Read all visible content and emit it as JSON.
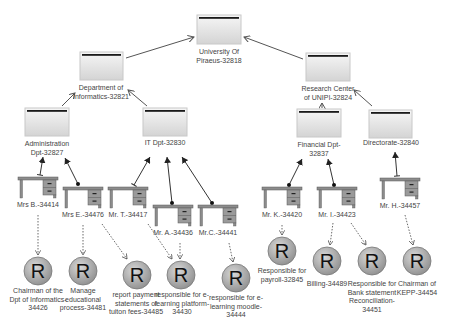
{
  "diagram": {
    "type": "organizational hierarchy",
    "units": [
      {
        "id": "u0",
        "label": "University Of\nPiraeus-32818",
        "x": 197,
        "y": 15,
        "lx": 219,
        "ly": 48
      },
      {
        "id": "u1",
        "label": "Department of\nInformatics-32821",
        "x": 80,
        "y": 52,
        "lx": 101,
        "ly": 84
      },
      {
        "id": "u2",
        "label": "Research Center\nof UNIPI-32824",
        "x": 306,
        "y": 53,
        "lx": 328,
        "ly": 85
      },
      {
        "id": "u3",
        "label": "Administration\nDpt-32827",
        "x": 25,
        "y": 108,
        "lx": 47,
        "ly": 140
      },
      {
        "id": "u4",
        "label": "IT Dpt-32830",
        "x": 143,
        "y": 108,
        "lx": 165,
        "ly": 140
      },
      {
        "id": "u5",
        "label": "Financial Dpt-\n32837",
        "x": 297,
        "y": 109,
        "lx": 319,
        "ly": 141
      },
      {
        "id": "u6",
        "label": "Directorate-32840",
        "x": 369,
        "y": 110,
        "lx": 391,
        "ly": 141
      }
    ],
    "persons": [
      {
        "id": "p0",
        "label": "Mrs B.-34414",
        "x": 18,
        "y": 177
      },
      {
        "id": "p1",
        "label": "Mrs E.-34476",
        "x": 63,
        "y": 187
      },
      {
        "id": "p2",
        "label": "Mr. T.-34417",
        "x": 108,
        "y": 187
      },
      {
        "id": "p3",
        "label": "Mr. A.-34436",
        "x": 153,
        "y": 205
      },
      {
        "id": "p4",
        "label": "Mr.C.-34441",
        "x": 198,
        "y": 205
      },
      {
        "id": "p5",
        "label": "Mr. K.-34420",
        "x": 262,
        "y": 187
      },
      {
        "id": "p6",
        "label": "Mr. I.-34423",
        "x": 317,
        "y": 187
      },
      {
        "id": "p7",
        "label": "Mr. H.-34457",
        "x": 380,
        "y": 178
      }
    ],
    "roles": [
      {
        "id": "r0",
        "label": "Chairman of the\nDpt of Informatics-\n34426",
        "cx": 38,
        "cy": 271
      },
      {
        "id": "r1",
        "label": "Manage\neducational\nprocess-34481",
        "cx": 83,
        "cy": 271
      },
      {
        "id": "r2",
        "label": "report payment\nstatements of\ntuiton fees-34485",
        "cx": 137,
        "cy": 275
      },
      {
        "id": "r3",
        "label": "responsible for e-\nlearning platform-\n34430",
        "cx": 181,
        "cy": 275
      },
      {
        "id": "r4",
        "label": "responsible for e-\nlearning moodle-\n34444",
        "cx": 236,
        "cy": 278
      },
      {
        "id": "r5",
        "label": "Responsible for\npayroll-32845",
        "cx": 282,
        "cy": 251
      },
      {
        "id": "r6",
        "label": "Billing-34489",
        "cx": 327,
        "cy": 261
      },
      {
        "id": "r7",
        "label": "Responsible for\nBank statement\nReconciliation-\n34451",
        "cx": 372,
        "cy": 261
      },
      {
        "id": "r8",
        "label": "Chairman of\nKEPP-34454",
        "cx": 417,
        "cy": 261
      }
    ],
    "role_glyph": "R",
    "colors": {
      "unit_bar": "#1a1a1a",
      "unit_fill_top": "#f4f4f4",
      "unit_fill_bottom": "#d6d6d6",
      "desk": "#8c8c8c",
      "desk_dark": "#5a5a5a",
      "role_fill": "#a8a8a8",
      "edge": "#555555",
      "label": "#444444"
    }
  }
}
